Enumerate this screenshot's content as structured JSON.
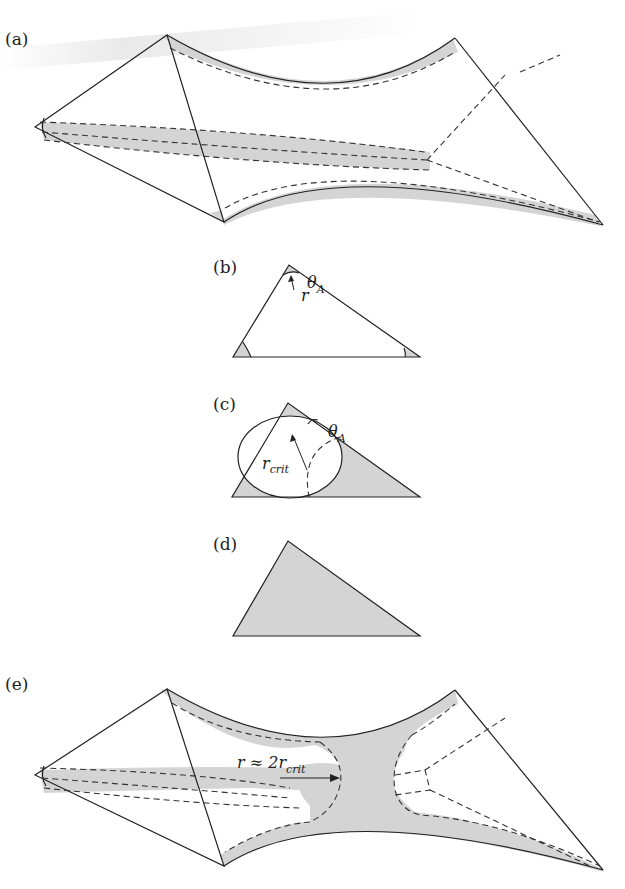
{
  "header": {
    "text": "...ppi g..."
  },
  "panels": [
    {
      "id": "a",
      "label": "(a)",
      "description": "Bowtie pore geometry with corner wetting films (small corner radius)"
    },
    {
      "id": "b",
      "label": "(b)",
      "description": "Triangle cross-section with corner arc menisci",
      "annotations": {
        "angle": "θ",
        "angle_sub": "A",
        "radius": "r"
      }
    },
    {
      "id": "c",
      "label": "(c)",
      "description": "Triangle cross-section at critical radius with inscribed circle",
      "annotations": {
        "angle": "θ",
        "angle_sub": "A",
        "radius": "r",
        "radius_sub": "crit"
      }
    },
    {
      "id": "d",
      "label": "(d)",
      "description": "Fully filled triangle cross-section"
    },
    {
      "id": "e",
      "label": "(e)",
      "description": "Bowtie pore with snap-off throat filling",
      "annotations": {
        "formula": "r ≈ 2r",
        "formula_sub": "crit"
      }
    }
  ],
  "colors": {
    "shade": "#d4d4d4",
    "line": "#222222",
    "background": "#ffffff"
  }
}
